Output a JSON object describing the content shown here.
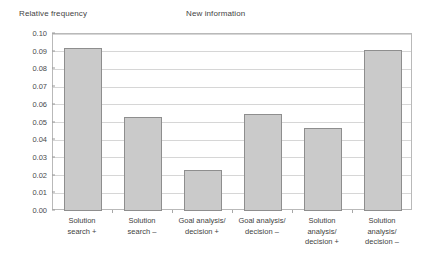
{
  "chart_data": {
    "type": "bar",
    "title": "New information",
    "xlabel": "",
    "ylabel": "Relative frequency",
    "categories": [
      "Solution\nsearch +",
      "Solution\nsearch –",
      "Goal analysis/\ndecision +",
      "Goal analysis/\ndecision –",
      "Solution\nanalysis/\ndecision +",
      "Solution\nanalysis/\ndecision –"
    ],
    "values": [
      0.092,
      0.053,
      0.023,
      0.055,
      0.047,
      0.091
    ],
    "ylim": [
      0.0,
      0.1
    ],
    "ytick_labels": [
      "0.00",
      "0.01",
      "0.02",
      "0.03",
      "0.04",
      "0.05",
      "0.06",
      "0.07",
      "0.08",
      "0.09",
      "0.10"
    ],
    "ytick_values": [
      0.0,
      0.01,
      0.02,
      0.03,
      0.04,
      0.05,
      0.06,
      0.07,
      0.08,
      0.09,
      0.1
    ],
    "grid": true,
    "legend": "none",
    "colors": {
      "bar_fill": "#cacaca",
      "bar_border": "#8e8e8e",
      "gridline": "#d6d6d6",
      "frame": "#b9b9b9",
      "text": "#3f3f3f",
      "background": "#ffffff"
    }
  }
}
